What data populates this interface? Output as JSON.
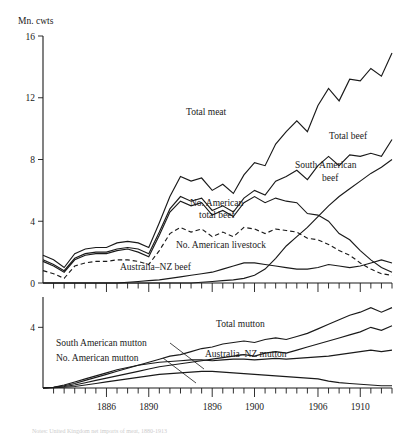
{
  "figure": {
    "y_axis_title": "Mn. cwts",
    "caption": "Notes: United Kingdom net imports of meat, 1880-1913"
  },
  "chart_data": [
    {
      "type": "line",
      "panel": "upper",
      "title": "",
      "xlabel": "",
      "ylabel": "Mn. cwts",
      "xlim": [
        1880,
        1913
      ],
      "ylim": [
        0,
        16
      ],
      "yticks": [
        0,
        4,
        8,
        12,
        16
      ],
      "xticks": [
        1886,
        1890,
        1896,
        1900,
        1906,
        1910
      ],
      "xtick_labels": [
        "1886",
        "1890",
        "1896",
        "1900",
        "1906",
        "1910"
      ],
      "grid": false,
      "legend": "inline-annotations",
      "x": [
        1880,
        1881,
        1882,
        1883,
        1884,
        1885,
        1886,
        1887,
        1888,
        1889,
        1890,
        1891,
        1892,
        1893,
        1894,
        1895,
        1896,
        1897,
        1898,
        1899,
        1900,
        1901,
        1902,
        1903,
        1904,
        1905,
        1906,
        1907,
        1908,
        1909,
        1910,
        1911,
        1912,
        1913
      ],
      "series": [
        {
          "name": "Total meat",
          "style": "solid",
          "label": "Total meat",
          "values": [
            1.8,
            1.5,
            1.0,
            1.9,
            2.2,
            2.3,
            2.3,
            2.6,
            2.7,
            2.6,
            2.3,
            3.9,
            5.6,
            6.9,
            6.6,
            6.8,
            6.0,
            6.4,
            5.8,
            7.0,
            7.8,
            7.6,
            9.0,
            9.8,
            10.5,
            9.8,
            11.5,
            12.6,
            11.8,
            13.2,
            13.1,
            13.9,
            13.4,
            14.9
          ]
        },
        {
          "name": "Total beef",
          "style": "solid",
          "label": "Total beef",
          "values": [
            1.5,
            1.2,
            0.8,
            1.6,
            1.9,
            2.0,
            2.0,
            2.2,
            2.3,
            2.2,
            1.9,
            3.3,
            4.8,
            5.6,
            5.3,
            5.5,
            4.7,
            5.0,
            4.6,
            5.5,
            6.0,
            5.7,
            6.6,
            6.9,
            7.3,
            6.7,
            7.6,
            8.2,
            7.6,
            8.3,
            8.2,
            8.4,
            8.2,
            9.3
          ]
        },
        {
          "name": "No. American total beef",
          "style": "solid",
          "label": "No. American total beef",
          "values": [
            1.4,
            1.1,
            0.7,
            1.5,
            1.8,
            1.9,
            1.9,
            2.1,
            2.2,
            2.0,
            1.7,
            3.1,
            4.6,
            5.3,
            5.0,
            5.2,
            4.4,
            4.7,
            4.3,
            5.2,
            5.6,
            5.2,
            5.5,
            5.3,
            5.2,
            4.5,
            4.4,
            4.0,
            3.2,
            2.8,
            2.1,
            1.5,
            1.0,
            0.7
          ]
        },
        {
          "name": "No. American livestock",
          "style": "dashed",
          "label": "No. American livestock",
          "values": [
            0.8,
            0.6,
            0.3,
            1.1,
            1.3,
            1.4,
            1.4,
            1.5,
            1.5,
            1.4,
            1.2,
            2.1,
            3.2,
            3.6,
            3.3,
            3.5,
            3.0,
            3.3,
            3.0,
            3.6,
            3.5,
            3.2,
            3.5,
            3.4,
            3.3,
            2.9,
            2.8,
            2.5,
            2.1,
            1.8,
            1.3,
            0.9,
            0.6,
            0.5
          ]
        },
        {
          "name": "South American beef",
          "style": "solid",
          "label": "South American beef",
          "values": [
            0.0,
            0.0,
            0.0,
            0.0,
            0.0,
            0.0,
            0.0,
            0.0,
            0.0,
            0.0,
            0.0,
            0.0,
            0.0,
            0.0,
            0.0,
            0.05,
            0.1,
            0.15,
            0.2,
            0.3,
            0.5,
            0.9,
            1.6,
            2.4,
            3.0,
            3.6,
            4.3,
            5.0,
            5.6,
            6.1,
            6.6,
            7.1,
            7.5,
            8.0
          ]
        },
        {
          "name": "Australia-NZ beef",
          "style": "solid",
          "label": "Australia–NZ beef",
          "values": [
            0.0,
            0.0,
            0.0,
            0.0,
            0.0,
            0.0,
            0.0,
            0.0,
            0.05,
            0.1,
            0.15,
            0.2,
            0.3,
            0.4,
            0.5,
            0.6,
            0.7,
            0.9,
            1.1,
            1.3,
            1.3,
            1.2,
            1.1,
            1.0,
            0.9,
            0.9,
            1.0,
            1.2,
            1.1,
            1.0,
            1.1,
            1.3,
            1.5,
            1.3
          ]
        }
      ]
    },
    {
      "type": "line",
      "panel": "lower",
      "title": "",
      "xlabel": "",
      "ylabel": "",
      "xlim": [
        1880,
        1913
      ],
      "ylim": [
        0,
        6
      ],
      "yticks": [
        4
      ],
      "xticks": [
        1886,
        1890,
        1896,
        1900,
        1906,
        1910
      ],
      "xtick_labels": [
        "1886",
        "1890",
        "1896",
        "1900",
        "1906",
        "1910"
      ],
      "grid": false,
      "legend": "inline-annotations",
      "x": [
        1880,
        1881,
        1882,
        1883,
        1884,
        1885,
        1886,
        1887,
        1888,
        1889,
        1890,
        1891,
        1892,
        1893,
        1894,
        1895,
        1896,
        1897,
        1898,
        1899,
        1900,
        1901,
        1902,
        1903,
        1904,
        1905,
        1906,
        1907,
        1908,
        1909,
        1910,
        1911,
        1912,
        1913
      ],
      "series": [
        {
          "name": "Total mutton",
          "style": "solid",
          "label": "Total mutton",
          "values": [
            0.0,
            0.05,
            0.15,
            0.3,
            0.5,
            0.7,
            0.9,
            1.1,
            1.3,
            1.5,
            1.7,
            1.9,
            2.1,
            2.2,
            2.4,
            2.6,
            2.7,
            2.9,
            3.0,
            3.1,
            3.0,
            3.2,
            3.3,
            3.2,
            3.4,
            3.6,
            3.9,
            4.2,
            4.5,
            4.8,
            5.0,
            5.3,
            5.0,
            5.3
          ]
        },
        {
          "name": "Australia-NZ mutton",
          "style": "solid",
          "label": "Australia–NZ mutton",
          "values": [
            0.0,
            0.03,
            0.1,
            0.2,
            0.35,
            0.5,
            0.65,
            0.8,
            0.95,
            1.1,
            1.25,
            1.4,
            1.5,
            1.6,
            1.7,
            1.8,
            1.9,
            2.0,
            2.1,
            2.2,
            2.1,
            2.3,
            2.4,
            2.3,
            2.5,
            2.7,
            2.9,
            3.1,
            3.3,
            3.5,
            3.7,
            4.0,
            3.8,
            4.1
          ]
        },
        {
          "name": "South American mutton",
          "style": "solid",
          "label": "South American mutton",
          "values": [
            0.0,
            0.05,
            0.2,
            0.4,
            0.6,
            0.8,
            1.0,
            1.2,
            1.35,
            1.5,
            1.6,
            1.7,
            1.75,
            1.8,
            1.85,
            1.85,
            1.8,
            1.85,
            1.9,
            1.9,
            1.85,
            1.9,
            1.95,
            1.9,
            1.95,
            2.0,
            2.05,
            2.1,
            2.2,
            2.3,
            2.4,
            2.5,
            2.4,
            2.5
          ]
        },
        {
          "name": "No. American mutton",
          "style": "solid",
          "label": "No. American mutton",
          "values": [
            0.0,
            0.02,
            0.05,
            0.1,
            0.2,
            0.3,
            0.4,
            0.5,
            0.6,
            0.7,
            0.8,
            0.9,
            0.95,
            1.0,
            1.05,
            1.1,
            1.1,
            1.05,
            1.0,
            0.95,
            0.9,
            0.85,
            0.8,
            0.75,
            0.7,
            0.65,
            0.6,
            0.45,
            0.35,
            0.3,
            0.25,
            0.2,
            0.15,
            0.15
          ]
        }
      ]
    }
  ]
}
